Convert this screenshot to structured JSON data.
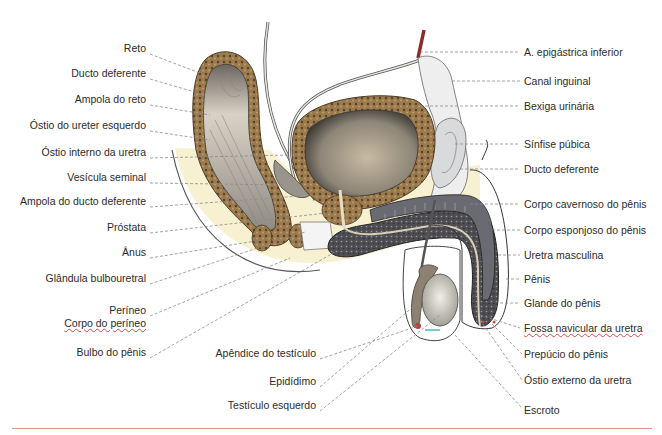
{
  "figure": {
    "rule_color": "#d9958a"
  },
  "labels_left": [
    {
      "id": "reto",
      "text": "Reto",
      "x": 146,
      "y": 48
    },
    {
      "id": "ducto-deferente-left",
      "text": "Ducto deferente",
      "x": 146,
      "y": 73
    },
    {
      "id": "ampola-reto",
      "text": "Ampola do reto",
      "x": 146,
      "y": 99
    },
    {
      "id": "ostio-ureter",
      "text": "Óstio do ureter esquerdo",
      "x": 146,
      "y": 125
    },
    {
      "id": "ostio-interno-uretra",
      "text": "Óstio interno da uretra",
      "x": 146,
      "y": 152
    },
    {
      "id": "vesicula-seminal",
      "text": "Vesícula seminal",
      "x": 146,
      "y": 177
    },
    {
      "id": "ampola-ducto-deferente",
      "text": "Ampola do ducto deferente",
      "x": 146,
      "y": 201
    },
    {
      "id": "prostata",
      "text": "Próstata",
      "x": 146,
      "y": 227
    },
    {
      "id": "anus",
      "text": "Ânus",
      "x": 146,
      "y": 252
    },
    {
      "id": "glandula-bulbouretral",
      "text": "Glândula bulbouretral",
      "x": 146,
      "y": 278
    },
    {
      "id": "perineo",
      "text": "Períneo",
      "x": 146,
      "y": 310
    },
    {
      "id": "corpo-perineo",
      "text": "Corpo do períneo",
      "x": 146,
      "y": 323,
      "underline": true
    },
    {
      "id": "bulbo-penis",
      "text": "Bulbo do pênis",
      "x": 146,
      "y": 352
    }
  ],
  "labels_bottom": [
    {
      "id": "apendice-testiculo",
      "text": "Apêndice do testículo",
      "x": 316,
      "y": 353
    },
    {
      "id": "epididimo",
      "text": "Epidídimo",
      "x": 316,
      "y": 381
    },
    {
      "id": "testiculo-esquerdo",
      "text": "Testículo esquerdo",
      "x": 316,
      "y": 405
    }
  ],
  "labels_right": [
    {
      "id": "a-epigastrica",
      "text": "A. epigástrica inferior",
      "x": 524,
      "y": 46
    },
    {
      "id": "canal-inguinal",
      "text": "Canal inguinal",
      "x": 524,
      "y": 75
    },
    {
      "id": "bexiga",
      "text": "Bexiga urinária",
      "x": 524,
      "y": 100
    },
    {
      "id": "sinfise-pubica",
      "text": "Sínfise púbica",
      "x": 524,
      "y": 138
    },
    {
      "id": "ducto-deferente-right",
      "text": "Ducto deferente",
      "x": 524,
      "y": 163
    },
    {
      "id": "corpo-cavernoso",
      "text": "Corpo cavernoso do pênis",
      "x": 524,
      "y": 198
    },
    {
      "id": "corpo-esponjoso",
      "text": "Corpo esponjoso do pênis",
      "x": 524,
      "y": 224
    },
    {
      "id": "uretra-masculina",
      "text": "Uretra masculina",
      "x": 524,
      "y": 249
    },
    {
      "id": "penis",
      "text": "Pênis",
      "x": 524,
      "y": 273
    },
    {
      "id": "glande",
      "text": "Glande do pênis",
      "x": 524,
      "y": 297
    },
    {
      "id": "fossa-navicular",
      "text": "Fossa navicular da uretra",
      "x": 524,
      "y": 322,
      "underline": true
    },
    {
      "id": "prepucio",
      "text": "Prepúcio do pênis",
      "x": 524,
      "y": 348
    },
    {
      "id": "ostio-externo",
      "text": "Óstio externo da uretra",
      "x": 524,
      "y": 374
    },
    {
      "id": "escroto",
      "text": "Escroto",
      "x": 524,
      "y": 404
    }
  ]
}
